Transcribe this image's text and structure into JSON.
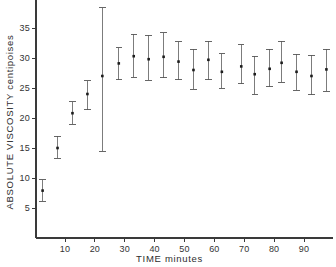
{
  "chart_data": {
    "type": "scatter",
    "title": "",
    "subtitle": "",
    "xlabel": "TIME minutes",
    "ylabel": "ABSOLUTE  VISCOSITY  centipoises",
    "ylabel_parts": [
      "ABSOLUTE",
      "VISCOSITY",
      "centipoises"
    ],
    "xlim": [
      0,
      99
    ],
    "ylim": [
      0,
      38
    ],
    "xticks": [
      10,
      20,
      30,
      40,
      50,
      60,
      70,
      80,
      90
    ],
    "yticks": [
      5,
      10,
      15,
      20,
      25,
      30,
      35
    ],
    "xtick_labels": [
      "10",
      "20",
      "30",
      "40",
      "50",
      "60",
      "70",
      "80",
      "90"
    ],
    "ytick_labels": [
      "5",
      "10",
      "15",
      "20",
      "25",
      "30",
      "35"
    ],
    "grid": false,
    "legend": null,
    "legend_position": "none",
    "error_bars": "vertical",
    "marker": "square",
    "series": [
      {
        "name": "Absolute viscosity",
        "x": [
          2.5,
          7.5,
          12.5,
          17.5,
          22.5,
          28,
          33,
          38,
          43,
          48,
          53,
          58,
          62.5,
          69,
          73.5,
          78.5,
          82.5,
          87.5,
          92.5,
          97.5
        ],
        "y": [
          7.9,
          15.0,
          20.8,
          24.0,
          27.0,
          29.1,
          30.3,
          29.8,
          30.2,
          29.4,
          28.0,
          29.7,
          27.7,
          28.6,
          27.3,
          28.2,
          29.2,
          27.7,
          27.0,
          28.1
        ],
        "y_upper": [
          9.7,
          17.0,
          22.7,
          26.2,
          38.4,
          31.7,
          34.0,
          33.8,
          34.2,
          32.7,
          31.5,
          32.8,
          30.7,
          32.2,
          30.3,
          31.5,
          32.8,
          30.6,
          30.5,
          31.5
        ],
        "y_lower": [
          6.1,
          13.3,
          19.0,
          21.4,
          14.5,
          26.4,
          26.8,
          26.3,
          26.7,
          26.4,
          24.8,
          26.4,
          25.0,
          25.7,
          24.0,
          25.2,
          26.0,
          24.6,
          23.9,
          24.5
        ]
      }
    ]
  },
  "figure": {
    "caption": "",
    "axis_color": "#3a3a3a",
    "marker_color": "#1c1c1c",
    "errorbar_color": "#6e6e6e"
  }
}
